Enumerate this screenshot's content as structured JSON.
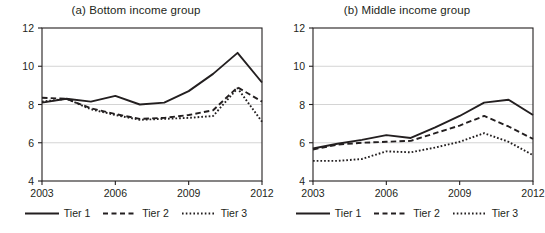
{
  "figure": {
    "width": 545,
    "height": 233,
    "background": "#ffffff",
    "line_color": "#231f20",
    "grid_color": "#c9c9c9",
    "axis_color": "#231f20"
  },
  "panels": [
    {
      "id": "panel-a",
      "title": "(a) Bottom income group",
      "legend": [
        {
          "label": "Tier 1",
          "style": "solid"
        },
        {
          "label": "Tier 2",
          "style": "dashed"
        },
        {
          "label": "Tier 3",
          "style": "dotted"
        }
      ]
    },
    {
      "id": "panel-b",
      "title": "(b) Middle income group",
      "legend": [
        {
          "label": "Tier 1",
          "style": "solid"
        },
        {
          "label": "Tier 2",
          "style": "dashed"
        },
        {
          "label": "Tier 3",
          "style": "dotted"
        }
      ]
    }
  ],
  "chart_data": [
    {
      "type": "line",
      "title": "(a) Bottom income group",
      "xlabel": "",
      "ylabel": "",
      "x": [
        2003,
        2004,
        2005,
        2006,
        2007,
        2008,
        2009,
        2010,
        2011,
        2012
      ],
      "xlim": [
        2003,
        2012
      ],
      "ylim": [
        4,
        12
      ],
      "xticks": [
        2003,
        2006,
        2009,
        2012
      ],
      "yticks": [
        4,
        6,
        8,
        10,
        12
      ],
      "xtick_labels": [
        "2003",
        "2006",
        "2009",
        "2012"
      ],
      "ytick_labels": [
        "4",
        "6",
        "8",
        "10",
        "12"
      ],
      "grid": "horizontal",
      "legend_position": "bottom",
      "series": [
        {
          "name": "Tier 1",
          "style": "solid",
          "values": [
            8.1,
            8.3,
            8.15,
            8.45,
            8.0,
            8.1,
            8.7,
            9.6,
            10.7,
            9.15
          ]
        },
        {
          "name": "Tier 2",
          "style": "dashed",
          "values": [
            8.35,
            8.3,
            7.8,
            7.5,
            7.25,
            7.3,
            7.45,
            7.7,
            8.9,
            8.15
          ]
        },
        {
          "name": "Tier 3",
          "style": "dotted",
          "values": [
            8.15,
            8.3,
            7.75,
            7.45,
            7.2,
            7.25,
            7.3,
            7.4,
            8.85,
            7.1
          ]
        }
      ]
    },
    {
      "type": "line",
      "title": "(b) Middle income group",
      "xlabel": "",
      "ylabel": "",
      "x": [
        2003,
        2004,
        2005,
        2006,
        2007,
        2008,
        2009,
        2010,
        2011,
        2012
      ],
      "xlim": [
        2003,
        2012
      ],
      "ylim": [
        4,
        12
      ],
      "xticks": [
        2003,
        2006,
        2009,
        2012
      ],
      "yticks": [
        4,
        6,
        8,
        10,
        12
      ],
      "xtick_labels": [
        "2003",
        "2006",
        "2009",
        "2012"
      ],
      "ytick_labels": [
        "4",
        "6",
        "8",
        "10",
        "12"
      ],
      "grid": "horizontal",
      "legend_position": "bottom",
      "series": [
        {
          "name": "Tier 1",
          "style": "solid",
          "values": [
            5.7,
            5.95,
            6.15,
            6.4,
            6.25,
            6.8,
            7.4,
            8.1,
            8.25,
            7.45
          ]
        },
        {
          "name": "Tier 2",
          "style": "dashed",
          "values": [
            5.65,
            5.9,
            6.0,
            6.05,
            6.1,
            6.5,
            6.9,
            7.4,
            6.85,
            6.2
          ]
        },
        {
          "name": "Tier 3",
          "style": "dotted",
          "values": [
            5.05,
            5.05,
            5.15,
            5.55,
            5.5,
            5.75,
            6.05,
            6.5,
            6.05,
            5.35
          ]
        }
      ]
    }
  ]
}
